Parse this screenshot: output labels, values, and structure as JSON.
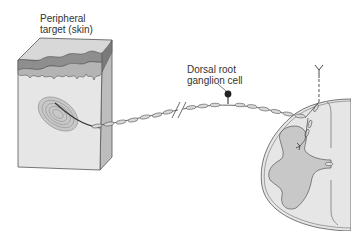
{
  "labels": {
    "peripheral_target_line1": "Peripheral",
    "peripheral_target_line2": "target (skin)",
    "drg_line1": "Dorsal root",
    "drg_line2": "ganglion cell"
  },
  "colors": {
    "background": "#ffffff",
    "skin_face": "#e4e4e4",
    "skin_top": "#d2d2d2",
    "epidermis_dark": "#8e8e8e",
    "epidermis_mid": "#b4b4b4",
    "skin_side": "#bdbdbd",
    "outline": "#555555",
    "cord_white": "#e6e6e6",
    "cord_gray": "#c8c8c8",
    "axon_segment": "#d9d9d9",
    "cell_body": "#222222"
  }
}
